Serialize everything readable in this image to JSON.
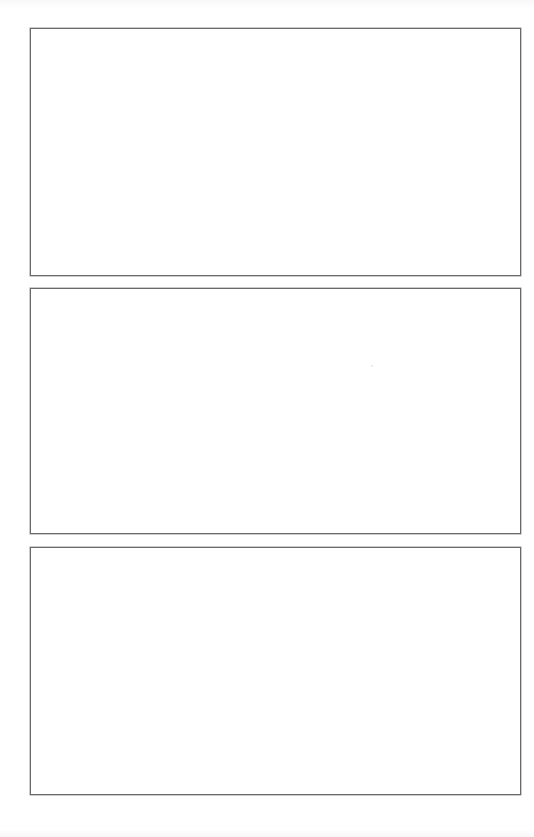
{
  "page": {
    "background_color": "#ffffff",
    "border_color": "#6a6a6a",
    "panels": [
      {
        "id": "panel-1",
        "content": ""
      },
      {
        "id": "panel-2",
        "content": ""
      },
      {
        "id": "panel-3",
        "content": ""
      }
    ]
  }
}
